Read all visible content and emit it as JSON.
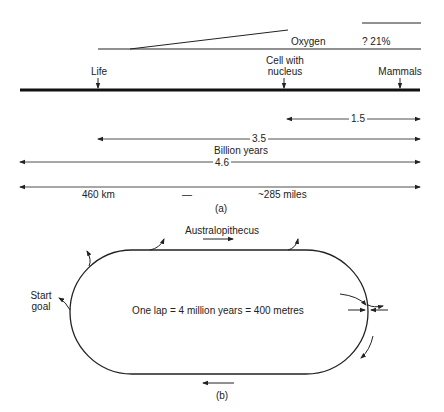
{
  "panel_a": {
    "oxygen_label": "Oxygen",
    "oxygen_value": "? 21%",
    "events": [
      {
        "label": "Life"
      },
      {
        "label_line1": "Cell with",
        "label_line2": "nucleus"
      },
      {
        "label": "Mammals"
      }
    ],
    "spans": {
      "span_1": "1.5",
      "span_2": "3.5",
      "unit": "Billion years",
      "span_3": "4.6"
    },
    "distance": {
      "km": "460 km",
      "dash": "—",
      "miles": "~285 miles"
    },
    "caption": "(a)"
  },
  "panel_b": {
    "top_label": "Australopithecus",
    "start_label_line1": "Start",
    "start_label_line2": "goal",
    "center_text": "One lap = 4 million years = 400 metres",
    "caption": "(b)"
  }
}
